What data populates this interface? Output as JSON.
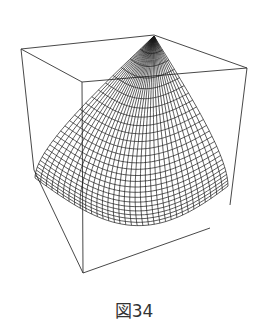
{
  "figure": {
    "caption": "図34",
    "colors": {
      "background": "#ffffff",
      "mesh": "#1a1a1a",
      "box": "#333333"
    },
    "box": {
      "top_left": [
        21,
        49
      ],
      "top_back": [
        154,
        35
      ],
      "top_right": [
        247,
        68
      ],
      "bottom": [
        83,
        273
      ]
    },
    "mesh": {
      "rows": 26,
      "cols": 34
    }
  }
}
